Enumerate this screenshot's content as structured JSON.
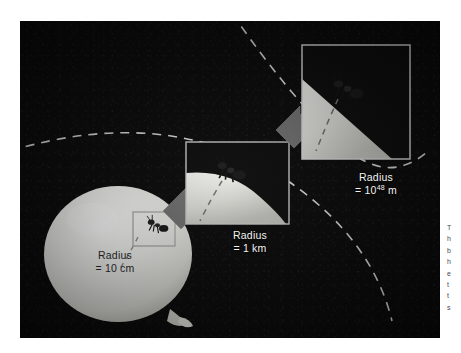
{
  "figure": {
    "background_color": "#ffffff",
    "panel_color": "#090909",
    "surface_color": "#d8d8d4",
    "balloon_color": "#e8e8e4",
    "arrow_color": "#6e6e6e",
    "box_border_color": "#b9b9b9",
    "dashed_line_color": "#ffffff",
    "caption_color": "#f2f2f2"
  },
  "captions": {
    "balloon": {
      "line1": "Radius",
      "line2": "= 10 cm",
      "value": 10,
      "unit": "cm"
    },
    "mid": {
      "line1": "Radius",
      "line2": "= 1 km",
      "value": 1,
      "unit": "km"
    },
    "far": {
      "line1": "Radius",
      "line2_prefix": "= 10",
      "exponent": "48",
      "line2_suffix": " m",
      "value": "10^48",
      "unit": "m"
    }
  },
  "scales": [
    {
      "name": "balloon",
      "radius_label": "Radius = 10 cm",
      "curvature": "strongly curved"
    },
    {
      "name": "magnified-1km",
      "radius_label": "Radius = 1 km",
      "curvature": "slightly curved"
    },
    {
      "name": "magnified-1e48m",
      "radius_label": "Radius = 10^48 m",
      "curvature": "essentially flat"
    }
  ],
  "margin_text": {
    "lines": [
      "T",
      "h",
      "b",
      "h",
      "e",
      "t",
      "t",
      "s"
    ]
  }
}
